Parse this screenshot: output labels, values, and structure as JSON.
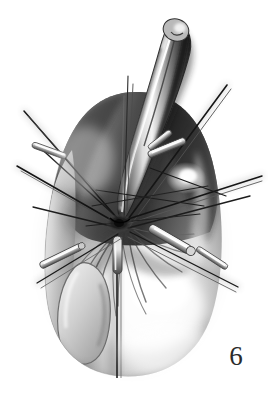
{
  "figure": {
    "number_label": "6",
    "caption": "",
    "domain": "medical-surgical-illustration",
    "medium": "grayscale airbrush and pencil rendering",
    "background_color": "#ffffff",
    "ink_color": "#1a1a1a",
    "canvas": {
      "width": 268,
      "height": 396
    }
  },
  "palette": {
    "paper_white": "#ffffff",
    "highlight_white": "#fbfbfb",
    "light_gray": "#d8d8d8",
    "mid_gray": "#9a9a9a",
    "shadow_gray": "#5a5a5a",
    "deep_shadow": "#2a2a2a",
    "near_black": "#101010",
    "suture_black": "#1b1b1b",
    "needle_silver": "#e6e6e6"
  },
  "anatomy": {
    "main_mass": {
      "name": "main-tissue-mass",
      "description": "large rounded ovoid body occupying lower two thirds",
      "bounds": {
        "x": 40,
        "y": 90,
        "width": 185,
        "height": 285
      }
    },
    "upper_tube": {
      "name": "upper-tubular-structure",
      "description": "elongated curved tube rising to upper right with rounded tip and specular highlight",
      "tip": {
        "x": 176,
        "y": 22
      },
      "base": {
        "x": 122,
        "y": 215
      }
    },
    "left_lobe": {
      "name": "left-inner-lobe",
      "description": "rounded inner lobe outlined on the lower left of the mass",
      "bounds": {
        "x": 52,
        "y": 262,
        "width": 62,
        "height": 110
      }
    },
    "vertical_strand": {
      "name": "central-vertical-strand",
      "description": "vertical suture or drain running from centre down past the lower margin",
      "x": 117,
      "y_top": 235,
      "y_bottom": 378
    },
    "fold_fan": {
      "name": "radiating-tissue-folds",
      "description": "fan of creases radiating downward and outward from the central knot zone"
    }
  },
  "instruments": {
    "knot_center": {
      "x": 118,
      "y": 222
    },
    "sutures": [
      {
        "name": "suture-upper-left-long",
        "x1": 24,
        "y1": 111,
        "x2": 124,
        "y2": 226,
        "weight": 1.5
      },
      {
        "name": "suture-left-upper",
        "x1": 36,
        "y1": 144,
        "x2": 122,
        "y2": 222,
        "weight": 1.4
      },
      {
        "name": "suture-left-mid",
        "x1": 17,
        "y1": 166,
        "x2": 120,
        "y2": 225,
        "weight": 1.5
      },
      {
        "name": "suture-left-lower",
        "x1": 33,
        "y1": 207,
        "x2": 119,
        "y2": 228,
        "weight": 1.3
      },
      {
        "name": "suture-lower-left-diagonal",
        "x1": 37,
        "y1": 283,
        "x2": 118,
        "y2": 234,
        "weight": 1.3
      },
      {
        "name": "suture-upper-right-long",
        "x1": 227,
        "y1": 85,
        "x2": 126,
        "y2": 222,
        "weight": 1.6
      },
      {
        "name": "suture-right-horizontal",
        "x1": 262,
        "y1": 176,
        "x2": 125,
        "y2": 220,
        "weight": 1.5
      },
      {
        "name": "suture-right-lower",
        "x1": 250,
        "y1": 196,
        "x2": 128,
        "y2": 228,
        "weight": 1.4
      },
      {
        "name": "suture-lower-right-diagonal",
        "x1": 238,
        "y1": 287,
        "x2": 130,
        "y2": 232,
        "weight": 1.4
      },
      {
        "name": "suture-vertical-top",
        "x1": 128,
        "y1": 76,
        "x2": 124,
        "y2": 220,
        "weight": 1.2
      }
    ],
    "needles": [
      {
        "name": "needle-left-upper",
        "x1": 36,
        "y1": 146,
        "x2": 62,
        "y2": 157,
        "thickness": 4
      },
      {
        "name": "needle-left-lower",
        "x1": 44,
        "y1": 265,
        "x2": 78,
        "y2": 248,
        "thickness": 5
      },
      {
        "name": "needle-right-upper",
        "x1": 150,
        "y1": 155,
        "x2": 182,
        "y2": 142,
        "thickness": 5
      },
      {
        "name": "needle-right-lower",
        "x1": 152,
        "y1": 228,
        "x2": 186,
        "y2": 249,
        "thickness": 6
      },
      {
        "name": "needle-right-far",
        "x1": 196,
        "y1": 247,
        "x2": 228,
        "y2": 270,
        "thickness": 4
      },
      {
        "name": "needle-center-vertical",
        "x1": 116,
        "y1": 238,
        "x2": 118,
        "y2": 272,
        "thickness": 5
      }
    ]
  },
  "annotations": {
    "figure_number_position": {
      "x": 228,
      "y": 356
    }
  }
}
